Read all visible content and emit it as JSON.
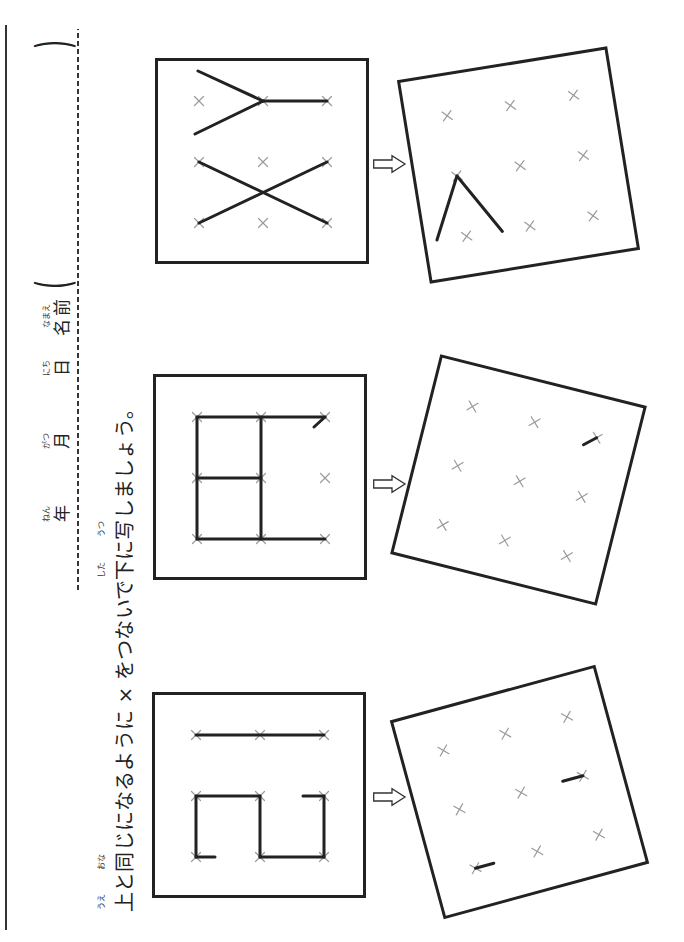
{
  "header": {
    "date_fields": [
      {
        "label": "年",
        "ruby": "ねん"
      },
      {
        "label": "月",
        "ruby": "がつ"
      },
      {
        "label": "日",
        "ruby": "にち"
      }
    ],
    "name_field": {
      "label": "名前",
      "ruby": "なまえ",
      "open_paren": "(",
      "close_paren": ")"
    }
  },
  "instruction": {
    "segments": [
      {
        "text": "上",
        "ruby": "うえ"
      },
      {
        "text": "と"
      },
      {
        "text": "同",
        "ruby": "おな"
      },
      {
        "text": "じになるように × をつないで"
      },
      {
        "text": "下",
        "ruby": "した"
      },
      {
        "text": "に"
      },
      {
        "text": "写",
        "ruby": "うつ"
      },
      {
        "text": "しましょう。"
      }
    ]
  },
  "colors": {
    "ink": "#222222",
    "marker": "#9a9a9a",
    "paper": "#ffffff"
  },
  "grid": {
    "marker_symbol": "×",
    "cols": [
      41,
      102,
      163
    ],
    "rows": [
      44,
      108,
      172
    ]
  },
  "arrow_icon": "hollow-arrow",
  "problems": [
    {
      "model": {
        "segments": [
          [
            163,
            44,
            163,
            172
          ],
          [
            102,
            44,
            41,
            44
          ],
          [
            41,
            44,
            41,
            63
          ],
          [
            102,
            44,
            102,
            108
          ],
          [
            102,
            108,
            41,
            108
          ],
          [
            41,
            108,
            41,
            172
          ],
          [
            41,
            172,
            102,
            172
          ],
          [
            102,
            172,
            102,
            151
          ]
        ]
      },
      "copy": {
        "rotation_deg": -15.2,
        "segments": [
          [
            102,
            172,
            102,
            151
          ],
          [
            41,
            44,
            41,
            63
          ]
        ]
      }
    },
    {
      "model": {
        "segments": [
          [
            41,
            44,
            41,
            172
          ],
          [
            163,
            44,
            163,
            172
          ],
          [
            163,
            172,
            153,
            161
          ],
          [
            41,
            44,
            163,
            44
          ],
          [
            41,
            108,
            163,
            108
          ],
          [
            102,
            44,
            102,
            108
          ]
        ]
      },
      "copy": {
        "rotation_deg": 14.1,
        "segments": [
          [
            163,
            172,
            153,
            161
          ]
        ]
      }
    },
    {
      "model": {
        "segments": [
          [
            193,
            43,
            163,
            108
          ],
          [
            130,
            40,
            163,
            108
          ],
          [
            163,
            108,
            163,
            172
          ],
          [
            102,
            44,
            41,
            172
          ],
          [
            41,
            44,
            102,
            172
          ]
        ]
      },
      "copy": {
        "rotation_deg": -9.2,
        "segments": [
          [
            102,
            44,
            42,
            14
          ],
          [
            102,
            44,
            40,
            80
          ]
        ]
      }
    }
  ]
}
